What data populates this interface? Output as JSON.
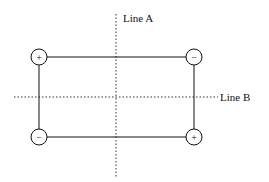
{
  "diagram": {
    "line_a_label": "Line A",
    "line_b_label": "Line B",
    "corners": {
      "top_left": "+",
      "top_right": "−",
      "bottom_left": "−",
      "bottom_right": "+"
    },
    "stroke_color": "#111111"
  }
}
